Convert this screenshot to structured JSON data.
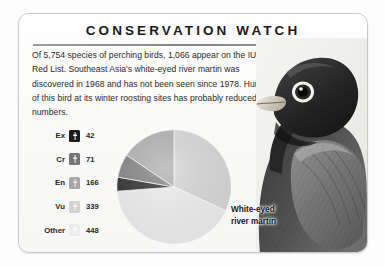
{
  "card": {
    "title": "CONSERVATION WATCH",
    "body_text": "Of 5,754 species of perching birds, 1,066 appear on the IUCN Red List. Southeast Asia's white-eyed river martin was discovered in 1968 and has not been seen since 1978. Hunting of this bird at its winter roosting sites has probably reduced its numbers."
  },
  "photo": {
    "caption_line1": "White-eyed",
    "caption_line2": "river martin",
    "alt_name": "white-eyed-river-martin-photo"
  },
  "legend": {
    "rows": [
      {
        "label": "Ex",
        "value": "42",
        "color": "#1d1d1d"
      },
      {
        "label": "Cr",
        "value": "71",
        "color": "#777777"
      },
      {
        "label": "En",
        "value": "166",
        "color": "#a8a8a8"
      },
      {
        "label": "Vu",
        "value": "339",
        "color": "#d2d2d2"
      },
      {
        "label": "Other",
        "value": "448",
        "color": "#ebebeb"
      }
    ]
  },
  "chart_data": {
    "type": "pie",
    "title": "",
    "total": 1066,
    "unit": "species",
    "start_angle_deg": 0,
    "direction": "clockwise",
    "legend_position": "left",
    "grid": false,
    "categories": [
      "Ex",
      "Cr",
      "En",
      "Vu",
      "Other"
    ],
    "category_labels": [
      "Ex",
      "Cr",
      "En",
      "Vu",
      "Other"
    ],
    "values": [
      42,
      71,
      166,
      339,
      448
    ],
    "colors": [
      "#1d1d1d",
      "#777777",
      "#a8a8a8",
      "#d2d2d2",
      "#ebebeb"
    ],
    "slice_order_clockwise_from_12": [
      "Vu",
      "Other",
      "Ex",
      "Cr",
      "En"
    ],
    "percentages": [
      3.9,
      6.7,
      15.6,
      31.8,
      42.0
    ]
  }
}
